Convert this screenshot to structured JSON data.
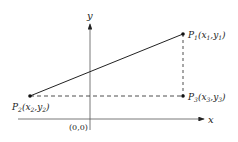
{
  "diagram": {
    "axes": {
      "x_label": "x",
      "y_label": "y",
      "origin_label": "(0,0)"
    },
    "points": [
      {
        "id": "P1",
        "name": "P",
        "sub": "1",
        "coords": "(x",
        "xs": "1",
        "sep": ",y",
        "ys": "1",
        "close": ")"
      },
      {
        "id": "P2",
        "name": "P",
        "sub": "2",
        "coords": "(x",
        "xs": "2",
        "sep": ",y",
        "ys": "2",
        "close": ")"
      },
      {
        "id": "P3",
        "name": "P",
        "sub": "3",
        "coords": "(x",
        "xs": "3",
        "sep": ",y",
        "ys": "3",
        "close": ")"
      }
    ],
    "segments": [
      {
        "from": "P2",
        "to": "P1",
        "style": "solid"
      },
      {
        "from": "P2",
        "to": "P3",
        "style": "dashed"
      },
      {
        "from": "P1",
        "to": "P3",
        "style": "dashed"
      }
    ],
    "colors": {
      "ink": "#222222",
      "axis": "#555555",
      "background": "#ffffff"
    }
  }
}
